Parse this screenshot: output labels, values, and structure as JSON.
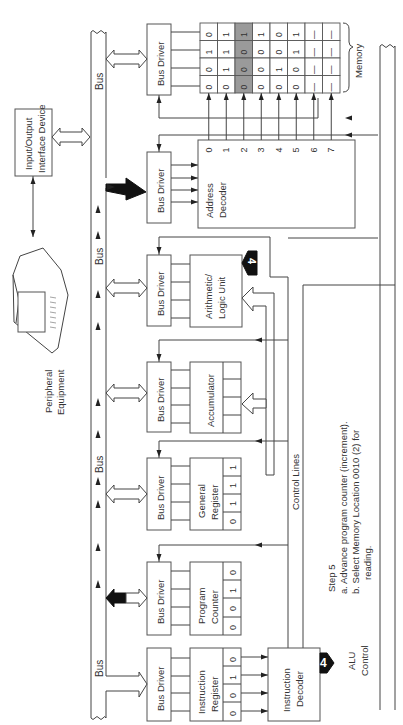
{
  "diagram": {
    "title": "Step 5",
    "orientation": "rotated-90-ccw",
    "step": {
      "heading": "Step 5",
      "item_a": "a.  Advance program counter (increment).",
      "item_b_line1": "b.  Select Memory Location 0010 (2) for",
      "item_b_line2": "reading."
    },
    "bus_label": "Bus",
    "control_lines_label": "Control Lines",
    "bus_driver_label": "Bus Driver",
    "io": {
      "line1": "Input/Output",
      "line2": "Interface Device"
    },
    "peripheral": {
      "line1": "Peripheral",
      "line2": "Equipment"
    },
    "instruction_register": {
      "line1": "Instruction",
      "line2": "Register",
      "bits": [
        "0",
        "0",
        "1",
        "0"
      ]
    },
    "program_counter": {
      "line1": "Program",
      "line2": "Counter",
      "bits": [
        "0",
        "0",
        "1",
        "0"
      ]
    },
    "general_register": {
      "line1": "General",
      "line2": "Register",
      "bits": [
        "0",
        "1",
        "1",
        "1"
      ]
    },
    "accumulator": {
      "label": "Accumulator",
      "bits": [
        "",
        "",
        "",
        ""
      ]
    },
    "alu": {
      "line1": "Arithmetic/",
      "line2": "Logic Unit",
      "badge": "4"
    },
    "instruction_decoder": {
      "line1": "Instruction",
      "line2": "Decoder",
      "badge": "4",
      "output_line1": "ALU",
      "output_line2": "Control"
    },
    "address_decoder": {
      "line1": "Address",
      "line2": "Decoder"
    },
    "memory": {
      "label": "Memory",
      "selected_address": 2,
      "highlight_color": "#9a9a9a",
      "addresses": [
        "0",
        "1",
        "2",
        "3",
        "4",
        "5",
        "6",
        "7"
      ],
      "words": [
        [
          "0",
          "1",
          "0",
          "0"
        ],
        [
          "1",
          "1",
          "1",
          "0"
        ],
        [
          "1",
          "0",
          "0",
          "0"
        ],
        [
          "1",
          "0",
          "0",
          "0"
        ],
        [
          "0",
          "0",
          "1",
          "0"
        ],
        [
          "1",
          "1",
          "0",
          "0"
        ],
        [
          "—",
          "—",
          "—",
          "—"
        ],
        [
          "—",
          "—",
          "—",
          "—"
        ]
      ]
    }
  }
}
